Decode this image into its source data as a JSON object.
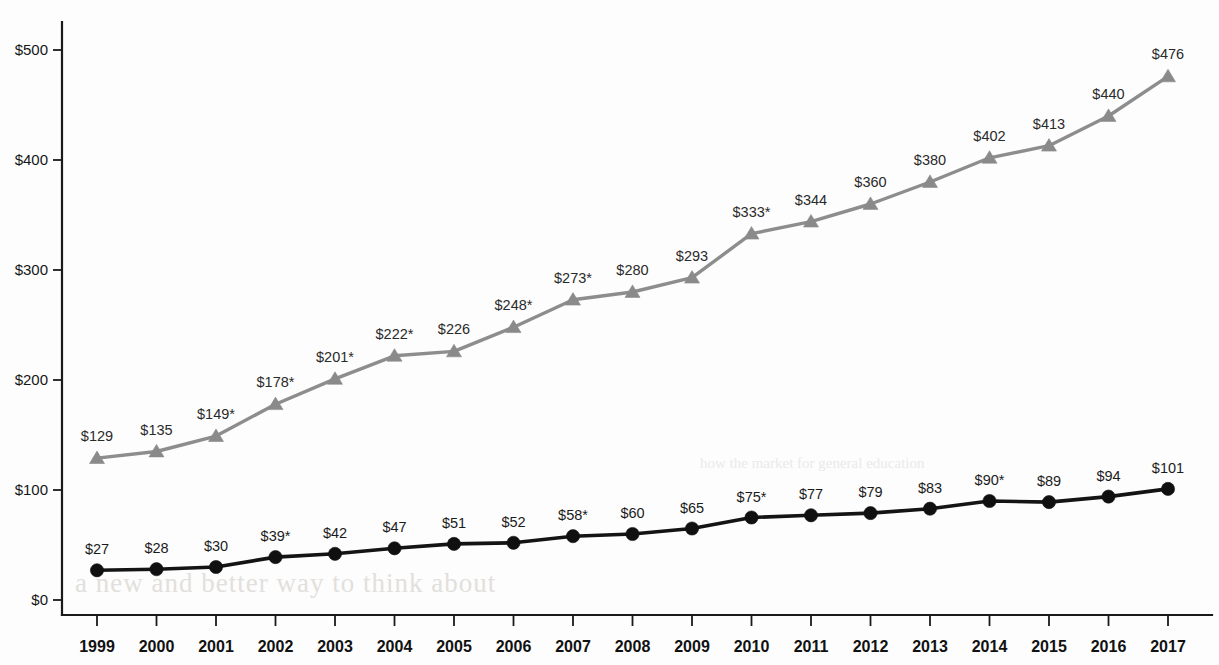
{
  "chart_data": {
    "type": "line",
    "title": "",
    "subtitle": "",
    "xlabel": "",
    "ylabel": "",
    "categories": [
      "1999",
      "2000",
      "2001",
      "2002",
      "2003",
      "2004",
      "2005",
      "2006",
      "2007",
      "2008",
      "2009",
      "2010",
      "2011",
      "2012",
      "2013",
      "2014",
      "2015",
      "2016",
      "2017"
    ],
    "ylim": [
      0,
      520
    ],
    "yticks": [
      0,
      100,
      200,
      300,
      400,
      500
    ],
    "ytick_labels": [
      "$0",
      "$100",
      "$200",
      "$300",
      "$400",
      "$500"
    ],
    "grid": false,
    "legend_position": "none",
    "series": [
      {
        "name": "upper-series",
        "marker": "triangle",
        "color": "#8a8a8a",
        "values": [
          129,
          135,
          149,
          178,
          201,
          222,
          226,
          248,
          273,
          280,
          293,
          333,
          344,
          360,
          380,
          402,
          413,
          440,
          476
        ],
        "labels": [
          "$129",
          "$135",
          "$149*",
          "$178*",
          "$201*",
          "$222*",
          "$226",
          "$248*",
          "$273*",
          "$280",
          "$293",
          "$333*",
          "$344",
          "$360",
          "$380",
          "$402",
          "$413",
          "$440",
          "$476"
        ]
      },
      {
        "name": "lower-series",
        "marker": "circle",
        "color": "#101010",
        "values": [
          27,
          28,
          30,
          39,
          42,
          47,
          51,
          52,
          58,
          60,
          65,
          75,
          77,
          79,
          83,
          90,
          89,
          94,
          101
        ],
        "labels": [
          "$27",
          "$28",
          "$30",
          "$39*",
          "$42",
          "$47",
          "$51",
          "$52",
          "$58*",
          "$60",
          "$65",
          "$75*",
          "$77",
          "$79",
          "$83",
          "$90*",
          "$89",
          "$94",
          "$101"
        ]
      }
    ],
    "annotations": {
      "asterisk_note": "*"
    }
  },
  "colors": {
    "axis": "#1a1a1a",
    "series_upper": "#8a8a8a",
    "series_lower": "#101010",
    "background": "#fdfdfd"
  },
  "background_bleed": {
    "line1": "a new and better way to think about",
    "line2": "how the market for general education"
  }
}
